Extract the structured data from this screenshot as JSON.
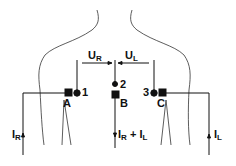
{
  "diagram": {
    "type": "electrode-placement",
    "electrodes": [
      {
        "id": "A",
        "label": "A",
        "kind": "current-electrode"
      },
      {
        "id": "B",
        "label": "B",
        "kind": "current-electrode"
      },
      {
        "id": "C",
        "label": "C",
        "kind": "current-electrode"
      }
    ],
    "sense_points": [
      {
        "id": "1",
        "label": "1"
      },
      {
        "id": "2",
        "label": "2"
      },
      {
        "id": "3",
        "label": "3"
      }
    ],
    "voltages": {
      "right": {
        "main": "U",
        "sub": "R"
      },
      "left": {
        "main": "U",
        "sub": "L"
      }
    },
    "currents": {
      "right": {
        "main": "I",
        "sub": "R"
      },
      "left": {
        "main": "I",
        "sub": "L"
      },
      "sum": {
        "main1": "I",
        "sub1": "R",
        "plus": " + ",
        "main2": "I",
        "sub2": "L"
      }
    },
    "colors": {
      "ink": "#111111",
      "background": "#ffffff"
    }
  }
}
